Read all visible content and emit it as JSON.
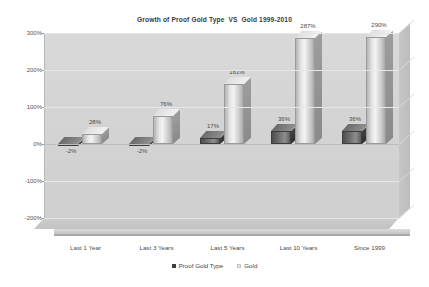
{
  "chart_data": {
    "type": "bar",
    "title": "Growth of Proof Gold Type  VS  Gold 1999-2010",
    "xlabel": "",
    "ylabel": "",
    "ylim": [
      -200,
      300
    ],
    "yticks": [
      "300%",
      "200%",
      "100%",
      "0%",
      "-100%",
      "-200%"
    ],
    "ytick_values": [
      300,
      200,
      100,
      0,
      -100,
      -200
    ],
    "grid": true,
    "legend_position": "bottom",
    "style": "3d-clustered-column",
    "categories": [
      "Last 1 Year",
      "Last 3 Years",
      "Last 5 Years",
      "Last 10 Years",
      "Since 1999"
    ],
    "series": [
      {
        "name": "Proof Gold Type",
        "color": "#5e5e5e",
        "values": [
          -2,
          -2,
          17,
          36,
          36
        ],
        "labels": [
          "-2%",
          "-2%",
          "17%",
          "36%",
          "36%"
        ]
      },
      {
        "name": "Gold",
        "color": "#dcdcdc",
        "values": [
          28,
          76,
          161,
          287,
          290
        ],
        "labels": [
          "28%",
          "76%",
          "161%",
          "287%",
          "290%"
        ]
      }
    ]
  },
  "legend": {
    "items": [
      {
        "label": "Proof Gold Type",
        "swatch": "proof"
      },
      {
        "label": "Gold",
        "swatch": "gold"
      }
    ]
  },
  "colors": {
    "background": "#ffffff",
    "plot_wall": "#d4d4d4",
    "gridline": "#e6e6e6",
    "text": "#4a4a4a",
    "series_proof": "#5e5e5e",
    "series_gold": "#dcdcdc"
  }
}
